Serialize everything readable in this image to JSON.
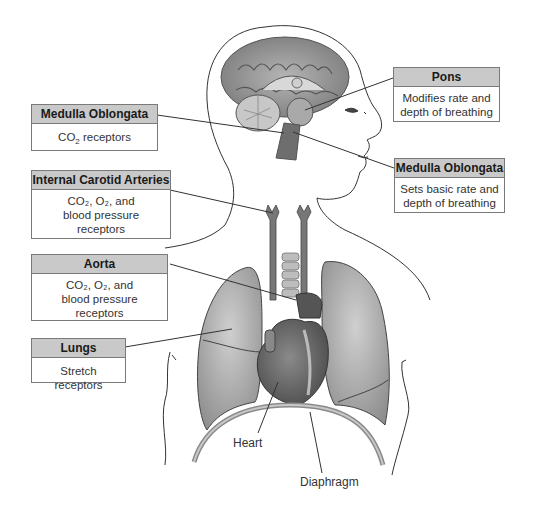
{
  "diagram": {
    "boxes": [
      {
        "id": "medulla-left",
        "title": "Medulla Oblongata",
        "body_parts": [
          "CO",
          "2",
          " receptors"
        ]
      },
      {
        "id": "carotid",
        "title": "Internal Carotid Arteries",
        "line1": "CO₂, O₂, and",
        "line2": "blood pressure",
        "line3": "receptors"
      },
      {
        "id": "aorta",
        "title": "Aorta",
        "line1": "CO₂, O₂, and",
        "line2": "blood pressure",
        "line3": "receptors"
      },
      {
        "id": "lungs",
        "title": "Lungs",
        "line1": "Stretch receptors"
      },
      {
        "id": "pons",
        "title": "Pons",
        "line1": "Modifies rate and",
        "line2": "depth of breathing"
      },
      {
        "id": "medulla-right",
        "title": "Medulla Oblongata",
        "line1": "Sets basic rate and",
        "line2": "depth of breathing"
      }
    ],
    "labels": {
      "heart": "Heart",
      "diaphragm": "Diaphragm"
    },
    "colors": {
      "header_fill": "#c9c9c9",
      "border": "#7a7a7a",
      "organ_gray": "#9a9a9a",
      "brain": "#8c8c8c"
    }
  }
}
